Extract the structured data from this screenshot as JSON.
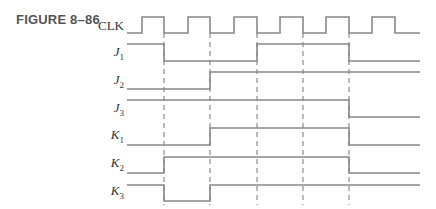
{
  "figure": {
    "title": "FIGURE 8–86"
  },
  "colors": {
    "trace": "#888888",
    "dash": "#777777",
    "text": "#333333",
    "title": "#555555"
  },
  "signals": [
    {
      "id": "clk",
      "label": "CLK",
      "sub": "",
      "y_low": 33,
      "y_high": 17
    },
    {
      "id": "j1",
      "label": "J",
      "sub": "1",
      "y_low": 61,
      "y_high": 44
    },
    {
      "id": "j2",
      "label": "J",
      "sub": "2",
      "y_low": 89,
      "y_high": 72
    },
    {
      "id": "j3",
      "label": "J",
      "sub": "3",
      "y_low": 117,
      "y_high": 100
    },
    {
      "id": "k1",
      "label": "K",
      "sub": "1",
      "y_low": 145,
      "y_high": 128
    },
    {
      "id": "k2",
      "label": "K",
      "sub": "2",
      "y_low": 173,
      "y_high": 157
    },
    {
      "id": "k3",
      "label": "K",
      "sub": "3",
      "y_low": 201,
      "y_high": 185
    }
  ],
  "timing": {
    "x_start": 127,
    "x_end": 420,
    "clock_rising_edges": [
      142,
      188,
      234,
      280,
      326,
      372
    ],
    "clock_falling_edges": [
      164,
      210,
      257,
      303,
      349,
      395
    ],
    "dashed_reference_lines": [
      164,
      210,
      257,
      303,
      349
    ],
    "waveforms": {
      "clk": [
        [
          127,
          0
        ],
        [
          142,
          1
        ],
        [
          164,
          0
        ],
        [
          188,
          1
        ],
        [
          210,
          0
        ],
        [
          234,
          1
        ],
        [
          257,
          0
        ],
        [
          280,
          1
        ],
        [
          303,
          0
        ],
        [
          326,
          1
        ],
        [
          349,
          0
        ],
        [
          372,
          1
        ],
        [
          395,
          0
        ],
        [
          420,
          0
        ]
      ],
      "j1": [
        [
          127,
          1
        ],
        [
          164,
          0
        ],
        [
          257,
          1
        ],
        [
          349,
          0
        ],
        [
          420,
          0
        ]
      ],
      "j2": [
        [
          127,
          0
        ],
        [
          210,
          1
        ],
        [
          420,
          1
        ]
      ],
      "j3": [
        [
          127,
          1
        ],
        [
          349,
          0
        ],
        [
          420,
          0
        ]
      ],
      "k1": [
        [
          127,
          0
        ],
        [
          210,
          1
        ],
        [
          349,
          0
        ],
        [
          420,
          0
        ]
      ],
      "k2": [
        [
          127,
          0
        ],
        [
          164,
          1
        ],
        [
          349,
          0
        ],
        [
          420,
          0
        ]
      ],
      "k3": [
        [
          127,
          1
        ],
        [
          164,
          0
        ],
        [
          210,
          1
        ],
        [
          420,
          1
        ]
      ]
    }
  }
}
